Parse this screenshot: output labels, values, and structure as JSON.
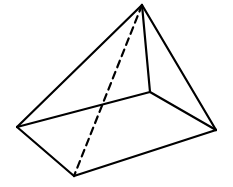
{
  "diagram": {
    "type": "pyramid-quadrilateral-base",
    "stroke_color": "#000000",
    "background": "#ffffff",
    "vertices": {
      "apex": [
        142,
        5
      ],
      "left": [
        17,
        127
      ],
      "front": [
        74,
        176
      ],
      "right": [
        216,
        130
      ],
      "back": [
        150,
        92
      ]
    },
    "visible_edges": [
      [
        "apex",
        "left"
      ],
      [
        "apex",
        "back"
      ],
      [
        "apex",
        "right"
      ],
      [
        "left",
        "back"
      ],
      [
        "back",
        "right"
      ],
      [
        "left",
        "front"
      ],
      [
        "front",
        "right"
      ]
    ],
    "hidden_edges": [
      [
        "apex",
        "front"
      ]
    ]
  }
}
